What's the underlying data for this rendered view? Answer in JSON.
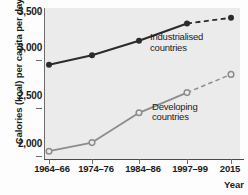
{
  "chart_data": {
    "type": "line",
    "title": "",
    "xlabel": "Year",
    "ylabel": "Calories (kcal) per capita per day",
    "categories": [
      "1964–66",
      "1974–76",
      "1984–86",
      "1997–99",
      "2015"
    ],
    "ylim": [
      1900,
      3560
    ],
    "yticks": [
      2000,
      2500,
      3000,
      3500
    ],
    "ytick_labels": [
      "2,000",
      "2,500",
      "3,000",
      "3,500"
    ],
    "grid": false,
    "legend_position": "inline-annotation",
    "series": [
      {
        "name": "Industrialised countries",
        "values": [
          2950,
          3050,
          3200,
          3380,
          3440
        ],
        "color": "#2b2b2b",
        "marker": "filled-circle",
        "projected_from_index": 3,
        "label_lines": [
          "Industrialised",
          "countries"
        ]
      },
      {
        "name": "Developing countries",
        "values": [
          2050,
          2140,
          2450,
          2660,
          2850
        ],
        "color": "#8c8c8c",
        "marker": "open-circle",
        "projected_from_index": 3,
        "label_lines": [
          "Developing",
          "countries"
        ]
      }
    ],
    "annotations": [
      {
        "text": "Industrialised countries",
        "series": 0
      },
      {
        "text": "Developing countries",
        "series": 1
      }
    ]
  },
  "axis": {
    "y_title": "Calories (kcal) per capita per day",
    "x_title": "Year",
    "y_labels": [
      "3,500",
      "3,000",
      "2,500",
      "2,000"
    ],
    "x_labels": [
      "1964–66",
      "1974–76",
      "1984–86",
      "1997–99",
      "2015"
    ]
  },
  "labels": {
    "industrialised_line1": "Industrialised",
    "industrialised_line2": "countries",
    "developing_line1": "Developing",
    "developing_line2": "countries"
  },
  "colors": {
    "industrialised": "#2b2b2b",
    "developing": "#8c8c8c",
    "plot_background": "#ebebeb",
    "axis": "#4a4a4a",
    "text": "#1b1b1b"
  }
}
